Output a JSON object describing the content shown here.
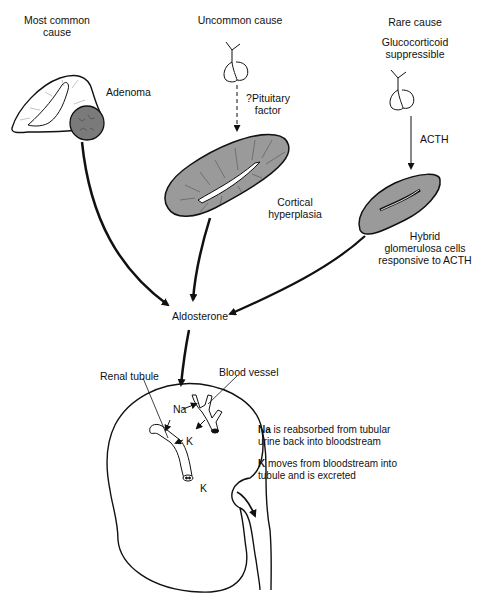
{
  "columns": {
    "most_common": {
      "heading_line1": "Most common",
      "heading_line2": "cause",
      "organ_label": "Adenoma"
    },
    "uncommon": {
      "heading": "Uncommon cause",
      "signal_label_line1": "?Pituitary",
      "signal_label_line2": "factor",
      "organ_label_line1": "Cortical",
      "organ_label_line2": "hyperplasia"
    },
    "rare": {
      "heading": "Rare cause",
      "subheading_line1": "Glucocorticoid",
      "subheading_line2": "suppressible",
      "signal_label": "ACTH",
      "organ_label_line1": "Hybrid",
      "organ_label_line2": "glomerulosa cells",
      "organ_label_line3": "responsive to ACTH"
    }
  },
  "center": {
    "hormone": "Aldosterone"
  },
  "kidney": {
    "renal_tubule_label": "Renal tubule",
    "blood_vessel_label": "Blood vessel",
    "na_label": "Na",
    "k_label": "K",
    "k_excreted_label": "K"
  },
  "notes": {
    "na_bold": "Na",
    "na_line1_rest": " is reabsorbed from tubular",
    "na_line2": "urine back into bloodstream",
    "k_bold": "K",
    "k_line1_rest": " moves from bloodstream into",
    "k_line2": "tubule and is excreted"
  },
  "colors": {
    "ink": "#111111",
    "organ_fill": "#9a9a9a",
    "adenoma_fill": "#7a7a7a"
  }
}
